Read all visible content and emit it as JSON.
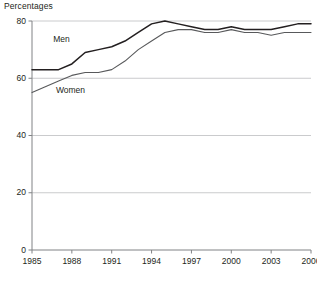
{
  "chart_data": {
    "type": "line",
    "title": "Percentages",
    "xlabel": "",
    "ylabel": "Percentages",
    "grid": true,
    "legend_position": "inline-labels",
    "xlim": [
      1985,
      2006
    ],
    "ylim": [
      0,
      80
    ],
    "ytick_values": [
      0,
      20,
      40,
      60,
      80
    ],
    "ytick_labels": [
      "0",
      "20",
      "40",
      "60",
      "80"
    ],
    "xtick_values": [
      1985,
      1988,
      1991,
      1994,
      1997,
      2000,
      2003,
      2006
    ],
    "xtick_labels": [
      "1985",
      "1988",
      "1991",
      "1994",
      "1997",
      "2000",
      "2003",
      "2006"
    ],
    "x": [
      1985,
      1986,
      1987,
      1988,
      1989,
      1990,
      1991,
      1992,
      1993,
      1994,
      1995,
      1996,
      1997,
      1998,
      1999,
      2000,
      2001,
      2002,
      2003,
      2004,
      2005,
      2006
    ],
    "series": [
      {
        "name": "Men",
        "color": "#231f20",
        "label_text": "Men",
        "values": [
          63,
          63,
          63,
          65,
          69,
          70,
          71,
          73,
          76,
          79,
          80,
          79,
          78,
          77,
          77,
          78,
          77,
          77,
          77,
          78,
          79,
          79
        ]
      },
      {
        "name": "Women",
        "color": "#58595b",
        "label_text": "Women",
        "values": [
          55,
          57,
          59,
          61,
          62,
          62,
          63,
          66,
          70,
          73,
          76,
          77,
          77,
          76,
          76,
          77,
          76,
          76,
          75,
          76,
          76,
          76
        ]
      }
    ],
    "annotations": [
      {
        "text": "Men",
        "x": 1986.6,
        "y": 73.5
      },
      {
        "text": "Women",
        "x": 1986.8,
        "y": 55.5
      }
    ]
  },
  "axis": {
    "top_label": "Percentages"
  },
  "colors": {
    "axis": "#808285",
    "grid": "#bcbec0",
    "text": "#231f20",
    "men_line": "#231f20",
    "women_line": "#58595b"
  }
}
